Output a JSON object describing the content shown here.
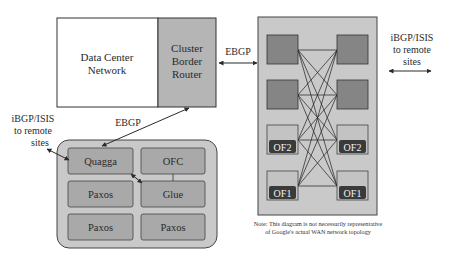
{
  "diagram": {
    "colors": {
      "background": "#ffffff",
      "panel_light": "#c9c9c9",
      "router_gray": "#b5b5b5",
      "switch_dark": "#858585",
      "of_label_bg": "#3a3a3a",
      "line": "#2a2a2a"
    },
    "data_center": {
      "network_label_line1": "Data Center",
      "network_label_line2": "Network",
      "border_router_line1": "Cluster",
      "border_router_line2": "Border",
      "border_router_line3": "Router"
    },
    "links": {
      "ebgp_top": "EBGP",
      "ebgp_bottom": "EBGP"
    },
    "remote_right": {
      "line1": "iBGP/ISIS",
      "line2": "to remote",
      "line3": "sites"
    },
    "remote_left": {
      "line1": "iBGP/ISIS",
      "line2": "to remote",
      "line3": "sites"
    },
    "switch_panel": {
      "switches": [
        {
          "id": "left-1",
          "label": ""
        },
        {
          "id": "right-1",
          "label": ""
        },
        {
          "id": "left-2",
          "label": ""
        },
        {
          "id": "right-2",
          "label": ""
        },
        {
          "id": "left-3",
          "label": "OF2"
        },
        {
          "id": "right-3",
          "label": "OF2"
        },
        {
          "id": "left-4",
          "label": "OF1"
        },
        {
          "id": "right-4",
          "label": "OF1"
        }
      ]
    },
    "controller_cluster": {
      "cells": [
        {
          "label": "Quagga"
        },
        {
          "label": "OFC"
        },
        {
          "label": "Paxos"
        },
        {
          "label": "Glue"
        },
        {
          "label": "Paxos"
        },
        {
          "label": "Paxos"
        }
      ]
    },
    "note": {
      "line1": "Note: This diagram is not necessarily representative",
      "line2": "of Google's actual WAN network topology"
    }
  }
}
